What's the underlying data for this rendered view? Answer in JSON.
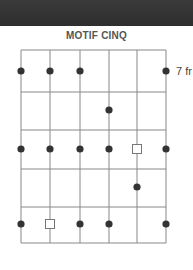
{
  "diagram": {
    "title": "MOTIF CINQ",
    "fret_label": "7 fr",
    "strings": 6,
    "frets": 5,
    "colors": {
      "line": "#888888",
      "dot": "#333333",
      "square_stroke": "#777777",
      "background": "#ffffff",
      "header": "#333333"
    },
    "notes": [
      {
        "string": 1,
        "fret": 0,
        "type": "dot"
      },
      {
        "string": 2,
        "fret": 0,
        "type": "dot"
      },
      {
        "string": 3,
        "fret": 0,
        "type": "dot"
      },
      {
        "string": 6,
        "fret": 0,
        "type": "dot"
      },
      {
        "string": 4,
        "fret": 1,
        "type": "dot"
      },
      {
        "string": 1,
        "fret": 2,
        "type": "dot"
      },
      {
        "string": 2,
        "fret": 2,
        "type": "dot"
      },
      {
        "string": 3,
        "fret": 2,
        "type": "dot"
      },
      {
        "string": 4,
        "fret": 2,
        "type": "dot"
      },
      {
        "string": 5,
        "fret": 2,
        "type": "root"
      },
      {
        "string": 6,
        "fret": 2,
        "type": "dot"
      },
      {
        "string": 5,
        "fret": 3,
        "type": "dot"
      },
      {
        "string": 1,
        "fret": 4,
        "type": "dot"
      },
      {
        "string": 2,
        "fret": 4,
        "type": "root"
      },
      {
        "string": 3,
        "fret": 4,
        "type": "dot"
      },
      {
        "string": 4,
        "fret": 4,
        "type": "dot"
      },
      {
        "string": 6,
        "fret": 4,
        "type": "dot"
      }
    ]
  }
}
